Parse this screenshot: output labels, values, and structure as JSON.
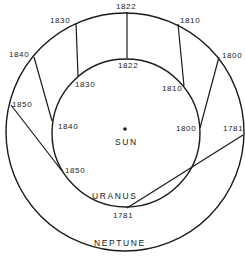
{
  "diagram": {
    "center_label": "SUN",
    "inner_orbit_label": "URANUS",
    "outer_orbit_label": "NEPTUNE",
    "positions": [
      {
        "year": "1781",
        "uranus_label": "1781",
        "neptune_label": "1781"
      },
      {
        "year": "1800",
        "uranus_label": "1800",
        "neptune_label": "1800"
      },
      {
        "year": "1810",
        "uranus_label": "1810",
        "neptune_label": "1810"
      },
      {
        "year": "1822",
        "uranus_label": "1822",
        "neptune_label": "1822"
      },
      {
        "year": "1830",
        "uranus_label": "1830",
        "neptune_label": "1830"
      },
      {
        "year": "1840",
        "uranus_label": "1840",
        "neptune_label": "1840"
      },
      {
        "year": "1850",
        "uranus_label": "1850",
        "neptune_label": "1850"
      }
    ]
  }
}
